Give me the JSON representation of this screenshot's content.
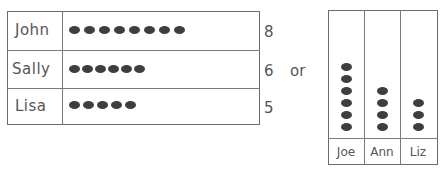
{
  "chart_data": [
    {
      "type": "pictograph",
      "orientation": "horizontal",
      "title": "",
      "categories": [
        "John",
        "Sally",
        "Lisa"
      ],
      "values": [
        8,
        6,
        5
      ],
      "value_labels": [
        "8",
        "6",
        "5"
      ],
      "symbol": "bean"
    },
    {
      "type": "pictograph",
      "orientation": "vertical",
      "title": "",
      "categories": [
        "Joe",
        "Ann",
        "Liz"
      ],
      "values": [
        6,
        4,
        3
      ],
      "symbol": "bean"
    }
  ],
  "connector_text": "or"
}
